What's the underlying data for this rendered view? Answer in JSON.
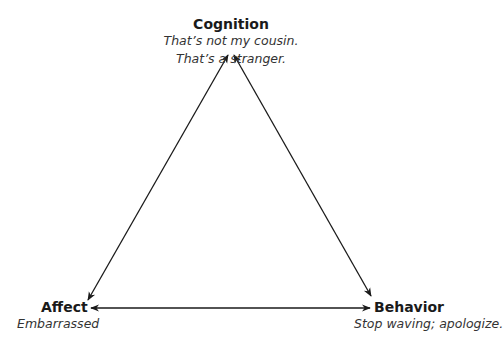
{
  "diagram": {
    "type": "cognitive-triangle",
    "nodes": [
      {
        "id": "cognition",
        "title": "Cognition",
        "lines": [
          "That’s not my cousin.",
          "That’s a stranger."
        ]
      },
      {
        "id": "affect",
        "title": "Affect",
        "lines": [
          "Embarrassed"
        ]
      },
      {
        "id": "behavior",
        "title": "Behavior",
        "lines": [
          "Stop waving; apologize."
        ]
      }
    ],
    "edges": [
      {
        "from": "cognition",
        "to": "affect",
        "bidirectional": true
      },
      {
        "from": "cognition",
        "to": "behavior",
        "bidirectional": true
      },
      {
        "from": "affect",
        "to": "behavior",
        "bidirectional": true
      }
    ],
    "colors": {
      "line": "#1a1a1a",
      "background": "#ffffff"
    }
  }
}
